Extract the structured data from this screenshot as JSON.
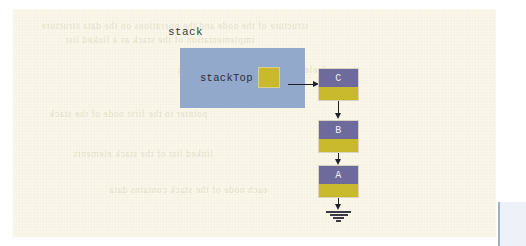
{
  "figure": {
    "title": "stack"
  },
  "stack_object": {
    "caption": "stack",
    "pointer_label": "stackTop",
    "pointer_cell_value": "",
    "box_color": "#92a9cb",
    "cell_color": "#c9b92d"
  },
  "nodes": [
    {
      "data": "C",
      "link_target": "B"
    },
    {
      "data": "B",
      "link_target": "A"
    },
    {
      "data": "A",
      "link_target": "null"
    }
  ],
  "colors": {
    "page": "#faf7ea",
    "stack_box": "#92a9cb",
    "node_data": "#6f6a9c",
    "node_link": "#c9b92d",
    "arrow": "#20202a",
    "node_text": "#f2f1f8"
  },
  "terminator": {
    "symbol": "ground",
    "meaning": "null"
  },
  "ghost_text": [
    "structure of the node and the operations on the data structure",
    "implementation of the stack as a linked list",
    "the stack element and the top of the stack",
    "pointer to the first node of the stack",
    "linked list of the stack elements",
    "each node of the stack contains data"
  ]
}
